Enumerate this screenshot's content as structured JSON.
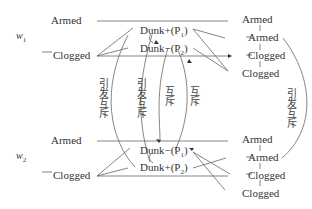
{
  "diagram": {
    "groups": [
      {
        "weight": "w",
        "weight_sub": "1",
        "left": {
          "armed": "Armed",
          "clogged": "Clogged"
        },
        "center": {
          "top": "Dunk+(P",
          "top_sub": "1",
          "top_end": ")",
          "bottom": "Dunk−(P",
          "bottom_sub": "2",
          "bottom_end": ")"
        },
        "right": [
          "Armed",
          "Armed",
          "Clogged",
          "Clogged"
        ]
      },
      {
        "weight": "w",
        "weight_sub": "2",
        "left": {
          "armed": "Armed",
          "clogged": "Clogged"
        },
        "center": {
          "top": "Dunk−(P",
          "top_sub": "1",
          "top_end": ")",
          "bottom": "Dunk+(P",
          "bottom_sub": "2",
          "bottom_end": ")"
        },
        "right": [
          "Armed",
          "Armed",
          "Clogged",
          "Clogged"
        ]
      }
    ],
    "relations": [
      {
        "label": "引发互斥"
      },
      {
        "label": "引发互斥"
      },
      {
        "label": "互斥"
      },
      {
        "label": "互斥"
      },
      {
        "label": "引发互斥"
      }
    ],
    "colors": {
      "line": "#555555",
      "text": "#333333"
    }
  }
}
